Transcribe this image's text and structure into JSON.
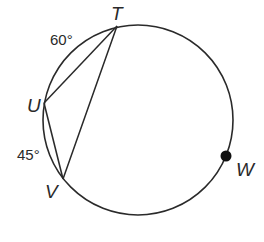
{
  "diagram": {
    "type": "circle-inscribed-angles",
    "circle": {
      "cx": 138,
      "cy": 120,
      "r": 95
    },
    "points": {
      "T": {
        "label": "T",
        "x": 117,
        "y": 26
      },
      "U": {
        "label": "U",
        "x": 44,
        "y": 103
      },
      "V": {
        "label": "V",
        "x": 63,
        "y": 179
      },
      "W": {
        "label": "W",
        "x": 226,
        "y": 156
      }
    },
    "segments": [
      [
        "T",
        "U"
      ],
      [
        "T",
        "V"
      ],
      [
        "U",
        "V"
      ]
    ],
    "arc_labels": {
      "TU": "60°",
      "UV": "45°"
    },
    "colors": {
      "stroke": "#2a2a2a",
      "background": "#ffffff"
    }
  }
}
